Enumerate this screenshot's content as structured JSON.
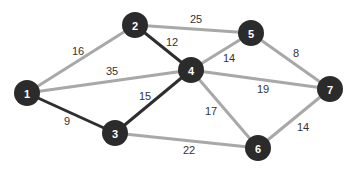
{
  "graph": {
    "nodes": [
      {
        "id": "1",
        "label": "1",
        "x": 27,
        "y": 93
      },
      {
        "id": "2",
        "label": "2",
        "x": 135,
        "y": 25
      },
      {
        "id": "3",
        "label": "3",
        "x": 115,
        "y": 133
      },
      {
        "id": "4",
        "label": "4",
        "x": 191,
        "y": 70
      },
      {
        "id": "5",
        "label": "5",
        "x": 251,
        "y": 33
      },
      {
        "id": "6",
        "label": "6",
        "x": 258,
        "y": 148
      },
      {
        "id": "7",
        "label": "7",
        "x": 330,
        "y": 89
      }
    ],
    "edges": [
      {
        "from": "1",
        "to": "2",
        "weight": "16",
        "style": "light",
        "label_x": 78,
        "label_y": 51
      },
      {
        "from": "1",
        "to": "4",
        "weight": "35",
        "style": "light",
        "label_x": 112,
        "label_y": 71
      },
      {
        "from": "1",
        "to": "3",
        "weight": "9",
        "style": "dark",
        "label_x": 67,
        "label_y": 121
      },
      {
        "from": "2",
        "to": "5",
        "weight": "25",
        "style": "light",
        "label_x": 196,
        "label_y": 19
      },
      {
        "from": "2",
        "to": "4",
        "weight": "12",
        "style": "dark",
        "label_x": 172,
        "label_y": 42
      },
      {
        "from": "3",
        "to": "4",
        "weight": "15",
        "style": "dark",
        "label_x": 145,
        "label_y": 96
      },
      {
        "from": "3",
        "to": "6",
        "weight": "22",
        "style": "light",
        "label_x": 189,
        "label_y": 150
      },
      {
        "from": "4",
        "to": "5",
        "weight": "14",
        "style": "light",
        "label_x": 229,
        "label_y": 58
      },
      {
        "from": "4",
        "to": "7",
        "weight": "19",
        "style": "light",
        "label_x": 263,
        "label_y": 89
      },
      {
        "from": "4",
        "to": "6",
        "weight": "17",
        "style": "light",
        "label_x": 211,
        "label_y": 111
      },
      {
        "from": "5",
        "to": "7",
        "weight": "8",
        "style": "light",
        "label_x": 296,
        "label_y": 53
      },
      {
        "from": "6",
        "to": "7",
        "weight": "14",
        "style": "light",
        "label_x": 303,
        "label_y": 127
      }
    ],
    "colors": {
      "node_fill": "#2b2b2b",
      "node_text": "#ffffff",
      "edge_light": "#a8a8a8",
      "edge_dark": "#2e2e2e",
      "weight_text": "#333333"
    }
  }
}
